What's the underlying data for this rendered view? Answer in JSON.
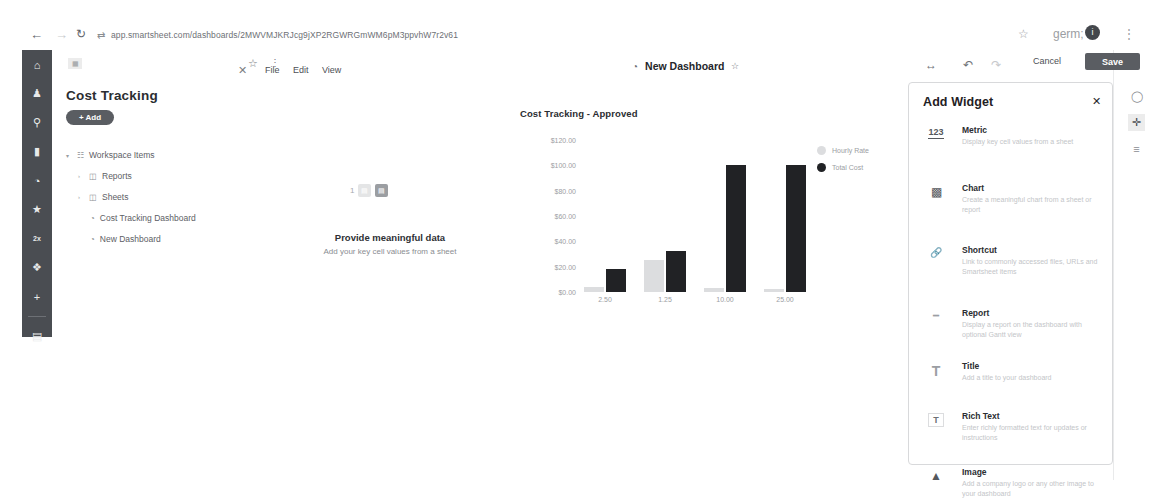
{
  "browser": {
    "url": "app.smartsheet.com/dashboards/2MWVMJKRJcg9jXP2RGWRGmWM6pM3ppvhW7r2v61",
    "back_icon": "back-arrow-icon",
    "forward_icon": "forward-arrow-icon",
    "reload_icon": "reload-icon",
    "site_icon": "site-info-icon",
    "bookmark_icon": "star-icon",
    "extensions_icon": "extensions-icon",
    "profile_initial": "i",
    "menu_icon": "kebab-menu-icon"
  },
  "left_rail": {
    "items": [
      {
        "name": "home",
        "glyph": "⌂"
      },
      {
        "name": "notifications",
        "glyph": "♟"
      },
      {
        "name": "search",
        "glyph": "⚲"
      },
      {
        "name": "browse",
        "glyph": "▬"
      },
      {
        "name": "recents",
        "glyph": "◔"
      },
      {
        "name": "favorites",
        "glyph": "★"
      },
      {
        "name": "workapps",
        "glyph": "2×"
      },
      {
        "name": "solutions",
        "glyph": "❖"
      },
      {
        "name": "create",
        "glyph": "+"
      }
    ],
    "bottom_item": {
      "name": "account",
      "glyph": "▤"
    }
  },
  "workspace": {
    "tab_icon": "grid-icon",
    "tab_star_icon": "star-icon",
    "tab_menu_icon": "kebab-menu-icon",
    "tab_close_icon": "close-icon",
    "menus": [
      "File",
      "Edit",
      "View"
    ],
    "title": "Cost Tracking",
    "add_label": "+ Add",
    "tree": [
      {
        "label": "Workspace Items",
        "icon": "workspace-icon",
        "caret": "⌄",
        "indent": 14
      },
      {
        "label": "Reports",
        "icon": "folder-icon",
        "caret": "›",
        "indent": 26
      },
      {
        "label": "Sheets",
        "icon": "folder-icon",
        "caret": "›",
        "indent": 26
      },
      {
        "label": "Cost Tracking Dashboard",
        "icon": "dashboard-icon",
        "caret": "",
        "indent": 38
      },
      {
        "label": "New Dashboard",
        "icon": "dashboard-icon",
        "caret": "",
        "indent": 38
      }
    ]
  },
  "dashboard_header": {
    "clock_icon": "dashboard-clock-icon",
    "title": "New Dashboard",
    "star_icon": "star-icon"
  },
  "toolbar": {
    "resize_icon": "resize-horizontal-icon",
    "undo_icon": "undo-icon",
    "redo_icon": "redo-icon",
    "cancel_label": "Cancel",
    "save_label": "Save",
    "save_color": "#5a5d62"
  },
  "metric_widget": {
    "counter": "1",
    "heading": "Provide meaningful data",
    "subtext": "Add your key cell values from a sheet"
  },
  "chart_data": {
    "type": "bar",
    "title": "Cost Tracking - Approved",
    "categories": [
      "2.50",
      "1.25",
      "10.00",
      "25.00"
    ],
    "series": [
      {
        "name": "Hourly Rate",
        "color": "#dcdddf",
        "values": [
          4,
          25,
          3,
          2
        ]
      },
      {
        "name": "Total Cost",
        "color": "#212225",
        "values": [
          18,
          32,
          100,
          100
        ]
      }
    ],
    "yticks": [
      "$120.00",
      "$100.00",
      "$80.00",
      "$60.00",
      "$40.00",
      "$20.00",
      "$0.00"
    ],
    "ylim": [
      0,
      120
    ],
    "xlabel": "",
    "ylabel": "",
    "grid": false,
    "legend_position": "right"
  },
  "add_widget_panel": {
    "title": "Add Widget",
    "close_icon": "close-icon",
    "items": [
      {
        "icon": "metric-123-icon",
        "name": "Metric",
        "desc": "Display key cell values from a sheet"
      },
      {
        "icon": "bar-chart-icon",
        "name": "Chart",
        "desc": "Create a meaningful chart from a sheet or report"
      },
      {
        "icon": "link-shortcut-icon",
        "name": "Shortcut",
        "desc": "Link to commonly accessed files, URLs and Smartsheet items"
      },
      {
        "icon": "report-icon",
        "name": "Report",
        "desc": "Display a report on the dashboard with optional Gantt view"
      },
      {
        "icon": "title-text-icon",
        "name": "Title",
        "desc": "Add a title to your dashboard"
      },
      {
        "icon": "rich-text-icon",
        "name": "Rich Text",
        "desc": "Enter richly formatted text for updates or instructions"
      },
      {
        "icon": "image-icon",
        "name": "Image",
        "desc": "Add a company logo or any other image to your dashboard"
      }
    ]
  },
  "right_edge": {
    "comment_icon": "comment-icon",
    "add_icon": "plus-icon",
    "settings_icon": "settings-sliders-icon"
  }
}
